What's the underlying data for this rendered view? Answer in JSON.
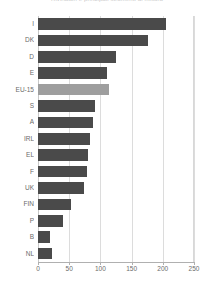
{
  "chart_data": {
    "type": "bar",
    "orientation": "horizontal",
    "title": "Rivelatori e principali strumenti di misura",
    "xlabel": "",
    "ylabel": "",
    "xlim": [
      0,
      250
    ],
    "xticks": [
      0,
      50,
      100,
      150,
      200,
      250
    ],
    "grid": true,
    "legend": "none",
    "highlight_category": "EU-15",
    "colors": {
      "bar": "#4a4a4a",
      "highlight_bar": "#9e9e9e",
      "grid": "#dcdcdc",
      "axis": "#b0b0b0",
      "text": "#6b6b6b",
      "background": "#ffffff"
    },
    "categories": [
      "I",
      "DK",
      "D",
      "E",
      "EU-15",
      "S",
      "A",
      "IRL",
      "EL",
      "F",
      "UK",
      "FIN",
      "P",
      "B",
      "NL"
    ],
    "values": [
      205,
      177,
      125,
      110,
      114,
      92,
      88,
      83,
      80,
      78,
      73,
      53,
      40,
      19,
      22
    ],
    "bars": [
      {
        "label": "I",
        "value": 205,
        "highlight": false
      },
      {
        "label": "DK",
        "value": 177,
        "highlight": false
      },
      {
        "label": "D",
        "value": 125,
        "highlight": false
      },
      {
        "label": "E",
        "value": 110,
        "highlight": false
      },
      {
        "label": "EU-15",
        "value": 114,
        "highlight": true
      },
      {
        "label": "S",
        "value": 92,
        "highlight": false
      },
      {
        "label": "A",
        "value": 88,
        "highlight": false
      },
      {
        "label": "IRL",
        "value": 83,
        "highlight": false
      },
      {
        "label": "EL",
        "value": 80,
        "highlight": false
      },
      {
        "label": "F",
        "value": 78,
        "highlight": false
      },
      {
        "label": "UK",
        "value": 73,
        "highlight": false
      },
      {
        "label": "FIN",
        "value": 53,
        "highlight": false
      },
      {
        "label": "P",
        "value": 40,
        "highlight": false
      },
      {
        "label": "B",
        "value": 19,
        "highlight": false
      },
      {
        "label": "NL",
        "value": 22,
        "highlight": false
      }
    ],
    "xtick_labels": [
      "0",
      "50",
      "100",
      "150",
      "200",
      "250"
    ]
  }
}
